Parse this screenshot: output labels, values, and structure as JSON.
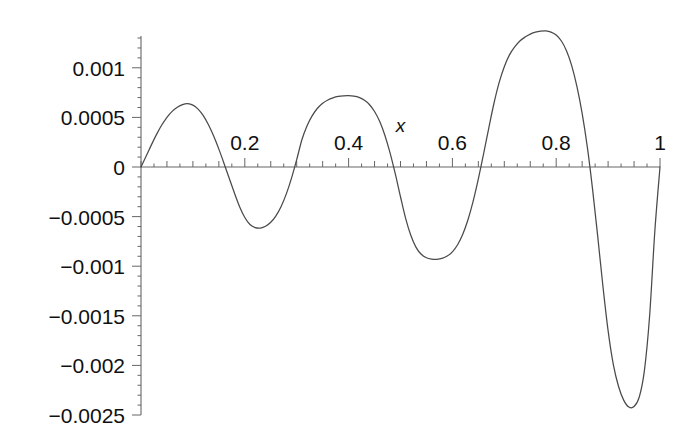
{
  "figure": {
    "background_color": "#ffffff",
    "axis_color": "#666666",
    "curve_color": "#4a4a4a",
    "text_color": "#101010"
  },
  "chart_data": {
    "type": "line",
    "title": "",
    "xlabel": "x",
    "ylabel": "",
    "xlim": [
      0,
      1
    ],
    "ylim": [
      -0.0025,
      0.0014
    ],
    "grid": false,
    "legend": null,
    "x_ticks": [
      {
        "value": 0.2,
        "label": "0.2"
      },
      {
        "value": 0.4,
        "label": "0.4"
      },
      {
        "value": 0.6,
        "label": "0.6"
      },
      {
        "value": 0.8,
        "label": "0.8"
      },
      {
        "value": 1.0,
        "label": "1"
      }
    ],
    "x_minor_tick_step": 0.025,
    "x_major_tick_step": 0.05,
    "y_ticks": [
      {
        "value": 0.001,
        "label": "0.001"
      },
      {
        "value": 0.0005,
        "label": "0.0005"
      },
      {
        "value": 0.0,
        "label": "0"
      },
      {
        "value": -0.0005,
        "label": "−0.0005"
      },
      {
        "value": -0.001,
        "label": "−0.001"
      },
      {
        "value": -0.0015,
        "label": "−0.0015"
      },
      {
        "value": -0.002,
        "label": "−0.002"
      },
      {
        "value": -0.0025,
        "label": "−0.0025"
      }
    ],
    "y_minor_tick_step": 0.0001,
    "y_major_tick_step": 0.0005,
    "series": [
      {
        "name": "curve",
        "x": [
          0.0,
          0.01,
          0.02,
          0.03,
          0.04,
          0.05,
          0.06,
          0.07,
          0.08,
          0.09,
          0.1,
          0.11,
          0.12,
          0.13,
          0.14,
          0.15,
          0.16,
          0.17,
          0.18,
          0.19,
          0.2,
          0.21,
          0.22,
          0.23,
          0.24,
          0.25,
          0.26,
          0.27,
          0.28,
          0.29,
          0.3,
          0.31,
          0.32,
          0.33,
          0.34,
          0.35,
          0.36,
          0.37,
          0.38,
          0.39,
          0.4,
          0.41,
          0.42,
          0.43,
          0.44,
          0.45,
          0.46,
          0.47,
          0.48,
          0.49,
          0.5,
          0.51,
          0.52,
          0.53,
          0.54,
          0.55,
          0.56,
          0.57,
          0.58,
          0.59,
          0.6,
          0.61,
          0.62,
          0.63,
          0.64,
          0.65,
          0.66,
          0.67,
          0.68,
          0.69,
          0.7,
          0.71,
          0.72,
          0.73,
          0.74,
          0.75,
          0.76,
          0.77,
          0.78,
          0.79,
          0.8,
          0.81,
          0.82,
          0.83,
          0.84,
          0.85,
          0.86,
          0.87,
          0.88,
          0.89,
          0.9,
          0.91,
          0.92,
          0.93,
          0.94,
          0.95,
          0.96,
          0.97,
          0.98,
          0.99,
          1.0
        ],
        "y": [
          0.0,
          0.00011,
          0.000223,
          0.000329,
          0.000423,
          0.000501,
          0.000561,
          0.000602,
          0.000629,
          0.000638,
          0.000624,
          0.000584,
          0.000518,
          0.000426,
          0.000312,
          0.00018,
          3.6e-05,
          -0.000114,
          -0.000262,
          -0.0004,
          -0.000509,
          -0.00058,
          -0.000611,
          -0.000615,
          -0.000597,
          -0.000557,
          -0.000492,
          -0.000398,
          -0.000271,
          -0.000112,
          7.4e-05,
          0.000275,
          0.000417,
          0.000518,
          0.000592,
          0.000643,
          0.000676,
          0.000697,
          0.000711,
          0.000718,
          0.00072,
          0.000715,
          0.000702,
          0.000675,
          0.00063,
          0.00056,
          0.000458,
          0.000318,
          0.00014,
          -7e-05,
          -0.0003,
          -0.00052,
          -0.00069,
          -0.00081,
          -0.00088,
          -0.000915,
          -0.000928,
          -0.00093,
          -0.000921,
          -0.000898,
          -0.000855,
          -0.000784,
          -0.000678,
          -0.000532,
          -0.000344,
          -0.00012,
          0.00013,
          0.00039,
          0.00064,
          0.00085,
          0.00101,
          0.00113,
          0.00121,
          0.00127,
          0.00131,
          0.00134,
          0.00136,
          0.00137,
          0.001372,
          0.00136,
          0.00133,
          0.00127,
          0.00117,
          0.00102,
          0.00081,
          0.00054,
          0.0002,
          -0.00022,
          -0.0007,
          -0.0012,
          -0.00165,
          -0.00199,
          -0.00221,
          -0.00235,
          -0.00242,
          -0.002415,
          -0.00232,
          -0.00205,
          -0.0015,
          -0.00065,
          0.0
        ]
      }
    ],
    "annotations": [
      {
        "text": "x",
        "x": 0.5,
        "y": 0.00035,
        "role": "axis-name"
      }
    ]
  }
}
